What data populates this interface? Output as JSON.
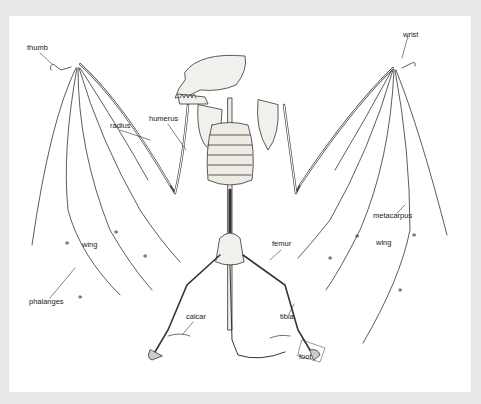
{
  "figure": {
    "labels": {
      "thumb": "thumb",
      "wrist": "wrist",
      "radius": "radius",
      "humerus": "humerus",
      "metacarpus": "metacarpus",
      "wing_left": "wing",
      "wing_right": "wing",
      "phalanges": "phalanges",
      "femur": "femur",
      "calcar": "calcar",
      "tibia": "tibia",
      "foot": "foot"
    }
  },
  "colors": {
    "background": "#e9e9e9",
    "panel": "#ffffff",
    "ink": "#222222",
    "bone_fill": "#f2f0ec"
  }
}
